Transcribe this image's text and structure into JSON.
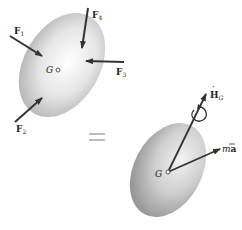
{
  "diagram": {
    "title": "",
    "left_body": {
      "center_label": "G",
      "forces": [
        {
          "name": "F",
          "sub": "1"
        },
        {
          "name": "F",
          "sub": "2"
        },
        {
          "name": "F",
          "sub": "3"
        },
        {
          "name": "F",
          "sub": "4"
        }
      ]
    },
    "equals_sign": "=",
    "right_body": {
      "center_label": "G",
      "angular_momentum": {
        "name": "H",
        "dot": "·",
        "sub": "G"
      },
      "linear": {
        "m": "m",
        "a": "a"
      }
    },
    "colors": {
      "body_light": "#f6f6f6",
      "body_dark": "#b8b8b8",
      "arrow": "#333333",
      "equals": "#bdbdbd"
    }
  }
}
